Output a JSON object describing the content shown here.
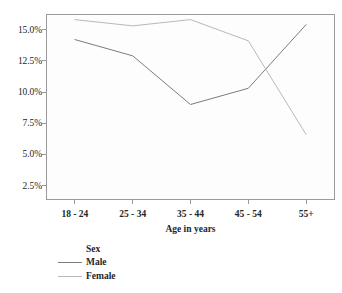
{
  "chart_data": {
    "type": "line",
    "title": "",
    "xlabel": "Age in years",
    "ylabel": "",
    "categories": [
      "18 - 24",
      "25 - 34",
      "35 - 44",
      "45 - 54",
      "55+"
    ],
    "series": [
      {
        "name": "Male",
        "values": [
          14.2,
          12.9,
          9.0,
          10.3,
          15.4
        ],
        "color": "#7c7c7c"
      },
      {
        "name": "Female",
        "values": [
          15.8,
          15.3,
          15.8,
          14.1,
          6.6
        ],
        "color": "#b9b9b9"
      }
    ],
    "ytick_labels": [
      "2.5%",
      "5.0%",
      "7.5%",
      "10.0%",
      "12.5%",
      "15.0%"
    ],
    "ytick_values": [
      2.5,
      5.0,
      7.5,
      10.0,
      12.5,
      15.0
    ],
    "ylim": [
      1.35,
      16.25
    ],
    "grid": false,
    "legend": {
      "title": "Sex",
      "position": "below-left",
      "entries": [
        "Male",
        "Female"
      ]
    }
  },
  "axes": {
    "x_title": "Age in years"
  },
  "legend": {
    "title": "Sex",
    "items": [
      {
        "label": "Male"
      },
      {
        "label": "Female"
      }
    ]
  },
  "colors": {
    "male_line": "#7c7c7c",
    "female_line": "#b9b9b9",
    "axis": "#9a9a9a",
    "text": "#262626",
    "plot_background": "#fdfdfd",
    "page_background": "#ffffff"
  }
}
